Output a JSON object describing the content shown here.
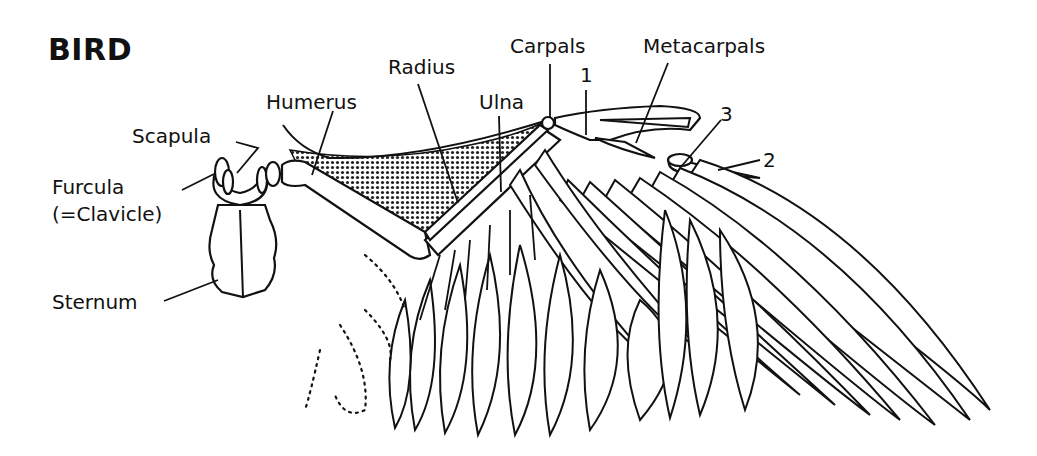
{
  "title": "BIRD",
  "labels": {
    "scapula": "Scapula",
    "furcula": "Furcula",
    "clavicle": "(=Clavicle)",
    "sternum": "Sternum",
    "humerus": "Humerus",
    "radius": "Radius",
    "ulna": "Ulna",
    "carpals": "Carpals",
    "metacarpals": "Metacarpals",
    "digit_1": "1",
    "digit_2": "2",
    "digit_3": "3"
  },
  "colors": {
    "line": "#111111",
    "background": "#ffffff"
  }
}
